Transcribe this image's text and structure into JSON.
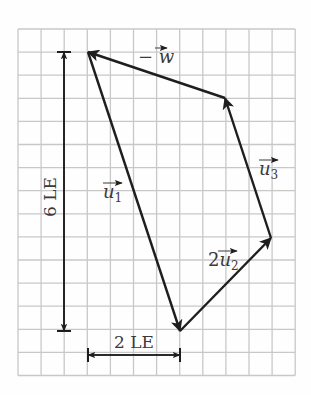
{
  "diagram": {
    "type": "vector-polygon",
    "grid": {
      "origin_x": 18,
      "origin_y": 29,
      "cell": 23.1,
      "cols": 12,
      "rows": 15,
      "line_color": "#c8c8c8",
      "border_color": "#bdbdbd"
    },
    "colors": {
      "ink": "#1e1e1e",
      "text": "#3a3a3a"
    },
    "points": {
      "A": [
        88,
        52
      ],
      "B": [
        180,
        331
      ],
      "C": [
        271,
        238
      ],
      "D": [
        225,
        98
      ]
    },
    "vectors": [
      {
        "id": "u1",
        "from": "A",
        "to": "B",
        "label": "u",
        "subscript": "1",
        "coef": "",
        "label_pos": [
          103,
          198
        ]
      },
      {
        "id": "2u2",
        "from": "B",
        "to": "C",
        "label": "u",
        "subscript": "2",
        "coef": "2",
        "label_pos": [
          208,
          266
        ]
      },
      {
        "id": "u3",
        "from": "C",
        "to": "D",
        "label": "u",
        "subscript": "3",
        "coef": "",
        "label_pos": [
          259,
          175
        ]
      },
      {
        "id": "neg-w",
        "from": "D",
        "to": "A",
        "label": "w",
        "subscript": "",
        "coef": "−",
        "label_pos": [
          138,
          63
        ]
      }
    ],
    "dimensions": [
      {
        "id": "height",
        "text": "6 LE",
        "from": [
          64,
          52
        ],
        "to": [
          64,
          331
        ],
        "label_pos": [
          56,
          197
        ],
        "rotate": -90
      },
      {
        "id": "width",
        "text": "2 LE",
        "from": [
          88,
          355
        ],
        "to": [
          180,
          355
        ],
        "label_pos": [
          134,
          348
        ],
        "rotate": 0
      }
    ]
  }
}
